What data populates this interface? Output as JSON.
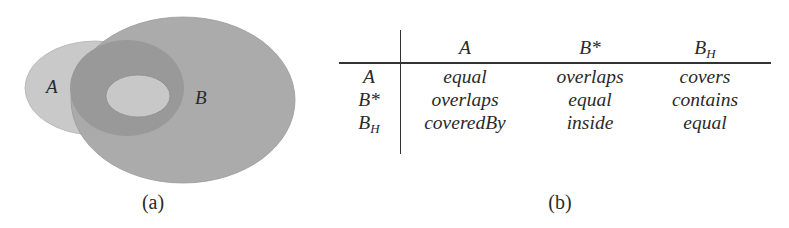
{
  "figure_a": {
    "caption": "(a)",
    "regions": [
      {
        "name": "A",
        "label": "A",
        "fill": "#c9c9c9"
      },
      {
        "name": "B",
        "label": "B",
        "fill": "#a7a7a7"
      },
      {
        "name": "overlap-ring",
        "label": "",
        "fill": "#999999"
      },
      {
        "name": "inner-core",
        "label": "",
        "fill": "#c7c7c7"
      }
    ],
    "labels": {
      "a": "A",
      "b": "B"
    }
  },
  "figure_b": {
    "caption": "(b)",
    "columns": [
      {
        "base": "A",
        "sub": ""
      },
      {
        "base": "B*",
        "sub": ""
      },
      {
        "base": "B",
        "sub": "H"
      }
    ],
    "rows": [
      {
        "header": {
          "base": "A",
          "sub": ""
        },
        "cells": [
          "equal",
          "overlaps",
          "covers"
        ]
      },
      {
        "header": {
          "base": "B*",
          "sub": ""
        },
        "cells": [
          "overlaps",
          "equal",
          "contains"
        ]
      },
      {
        "header": {
          "base": "B",
          "sub": "H"
        },
        "cells": [
          "coveredBy",
          "inside",
          "equal"
        ]
      }
    ]
  },
  "colors": {
    "ellipse_a": "#c9c9c9",
    "ellipse_b": "#a8a8a8",
    "ring": "#999999",
    "core": "#c8c8c8",
    "text": "#2a2a2a",
    "rule": "#333333"
  }
}
